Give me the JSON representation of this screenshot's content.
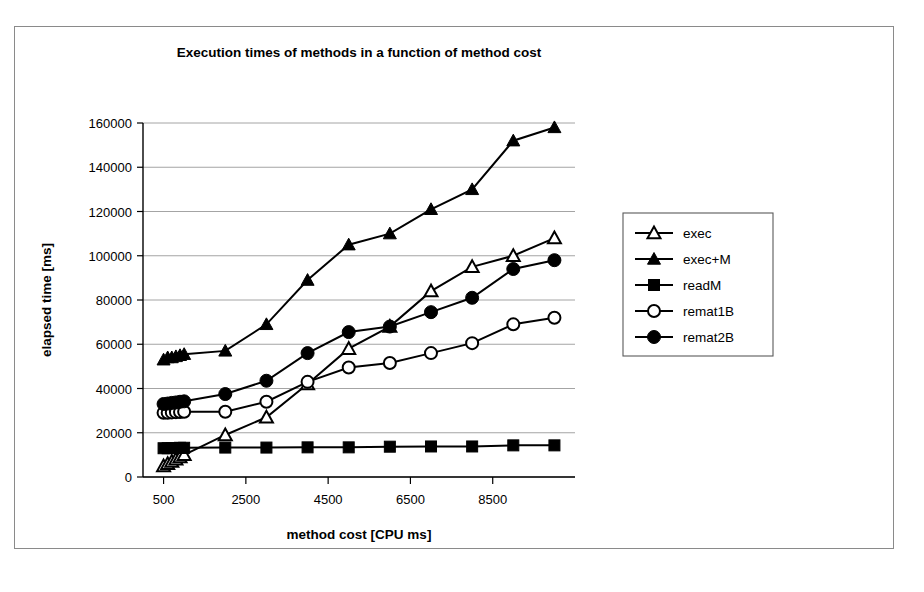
{
  "chart_data": {
    "type": "line",
    "title": "Execution times of methods in a function of method cost",
    "xlabel": "method cost [CPU ms]",
    "ylabel": "elapsed time [ms]",
    "xlim": [
      0,
      10500
    ],
    "ylim": [
      0,
      160000
    ],
    "xticks": [
      500,
      2500,
      4500,
      6500,
      8500
    ],
    "yticks": [
      0,
      20000,
      40000,
      60000,
      80000,
      100000,
      120000,
      140000,
      160000
    ],
    "grid": true,
    "legend_position": "right",
    "x": [
      500,
      600,
      700,
      800,
      900,
      1000,
      2000,
      3000,
      4000,
      5000,
      6000,
      7000,
      8000,
      9000,
      10000
    ],
    "series": [
      {
        "name": "exec",
        "marker": "open-triangle",
        "values": [
          5000,
          6000,
          7000,
          8000,
          9000,
          10000,
          19000,
          27000,
          42000,
          58000,
          68000,
          84000,
          95000,
          100000,
          108000
        ]
      },
      {
        "name": "exec+M",
        "marker": "filled-triangle",
        "values": [
          53000,
          54000,
          54000,
          54500,
          55000,
          55500,
          57000,
          69000,
          89000,
          105000,
          110000,
          121000,
          130000,
          152000,
          158000
        ]
      },
      {
        "name": "readM",
        "marker": "filled-square",
        "values": [
          13000,
          13000,
          13100,
          13100,
          13200,
          13200,
          13300,
          13300,
          13400,
          13400,
          13700,
          13800,
          13800,
          14300,
          14300
        ]
      },
      {
        "name": "remat1B",
        "marker": "open-circle",
        "values": [
          29000,
          29000,
          29200,
          29300,
          29400,
          29500,
          29500,
          34000,
          43000,
          49500,
          51500,
          56000,
          60500,
          69000,
          72000
        ]
      },
      {
        "name": "remat2B",
        "marker": "filled-circle",
        "values": [
          33000,
          33200,
          33500,
          33700,
          34000,
          34200,
          37500,
          43500,
          56000,
          65500,
          68000,
          74500,
          81000,
          94000,
          98000
        ]
      }
    ]
  },
  "legend": {
    "items": [
      {
        "label": "exec"
      },
      {
        "label": "exec+M"
      },
      {
        "label": "readM"
      },
      {
        "label": "remat1B"
      },
      {
        "label": "remat2B"
      }
    ]
  }
}
